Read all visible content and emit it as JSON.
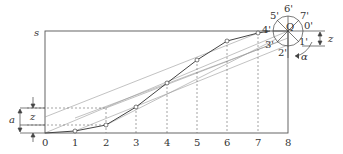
{
  "diagram": {
    "type": "cam displacement diagram construction",
    "axis_labels": {
      "vertical": "s",
      "origin": "0"
    },
    "x_ticks": [
      "0",
      "1",
      "2",
      "3",
      "4",
      "5",
      "6",
      "7",
      "8"
    ],
    "circle_labels": [
      "0'",
      "1'",
      "2'",
      "3'",
      "4'",
      "5'",
      "6'",
      "7'"
    ],
    "center_label": "Q",
    "dimension_labels": {
      "a": "a",
      "z": "z",
      "z_right": "z",
      "alpha": "α"
    },
    "curve_points": [
      [
        0,
        0
      ],
      [
        1,
        2
      ],
      [
        2,
        8
      ],
      [
        3,
        26
      ],
      [
        4,
        50
      ],
      [
        5,
        73
      ],
      [
        6,
        92
      ],
      [
        7,
        100
      ],
      [
        8,
        102
      ]
    ],
    "colors": {
      "line": "#555555",
      "thin": "#888888",
      "text": "#333333"
    }
  }
}
